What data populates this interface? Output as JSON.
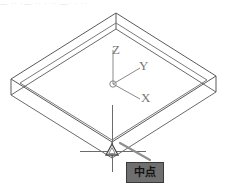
{
  "app": {
    "name": "cad-viewport",
    "background_color": "#ffffff",
    "line_color": "#5a5a5a"
  },
  "top_strip": {
    "text": "— ··  ·— ··  ·  ·· —· · ··",
    "note": "faint clipped toolbar text remnant"
  },
  "ucs_icon": {
    "name": "ucs-axis-icon",
    "origin": {
      "x": 113,
      "y": 84
    },
    "axes": [
      {
        "id": "z",
        "label": "Z",
        "end": {
          "x": 113,
          "y": 50
        }
      },
      {
        "id": "y",
        "label": "Y",
        "end": {
          "x": 140,
          "y": 68
        }
      },
      {
        "id": "x",
        "label": "X",
        "end": {
          "x": 140,
          "y": 99
        }
      }
    ],
    "label_color": "#777777"
  },
  "cursor": {
    "name": "crosshair-cursor",
    "position": {
      "x": 112,
      "y": 151
    },
    "horizontal_span": [
      80,
      146
    ],
    "vertical_span": [
      105,
      172
    ],
    "color": "#6b6b6b"
  },
  "osnap": {
    "name": "midpoint-snap-marker",
    "shape": "triangle",
    "position": {
      "x": 112,
      "y": 150
    },
    "size": 11,
    "color": "#555555"
  },
  "tooltip": {
    "name": "osnap-tooltip",
    "label": "中点",
    "background_color": "#6f6f6f",
    "border_color": "#3a3a3a",
    "text_color": "#141414",
    "leader_from": {
      "x": 148,
      "y": 158
    },
    "leader_to": {
      "x": 120,
      "y": 142
    }
  },
  "solid": {
    "name": "isometric-box",
    "description": "thin rectangular slab drawn in isometric wireframe",
    "top_face": [
      {
        "x": 116,
        "y": 13
      },
      {
        "x": 216,
        "y": 76
      },
      {
        "x": 112,
        "y": 142
      },
      {
        "x": 11,
        "y": 79
      }
    ],
    "thickness_px": 16,
    "stroke_color": "#5a5a5a",
    "stroke_width": 1
  }
}
